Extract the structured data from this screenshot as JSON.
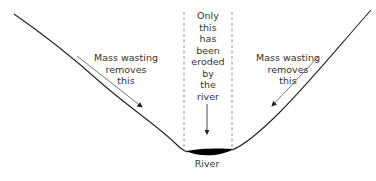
{
  "diagram": {
    "title": "",
    "labels": {
      "left_annotation": "Mass wasting\nremoves\nthis",
      "right_annotation": "Mass wasting\nremoves\nthis",
      "center_annotation": "Only\nthis\nhas\nbeen\neroded\nby\nthe\nriver",
      "river": "River"
    },
    "colors": {
      "line": "#222222",
      "arrow": "#555555",
      "dashed": "#888888",
      "river_fill": "#000000"
    }
  }
}
